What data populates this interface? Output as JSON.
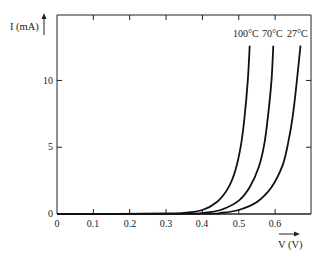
{
  "chart_data": {
    "type": "line",
    "title": "",
    "xlabel": "V (V)",
    "ylabel": "I (mA)",
    "xlim": [
      0,
      0.7
    ],
    "ylim": [
      0,
      14.9
    ],
    "grid": false,
    "legend_position": "inline-top-labels",
    "x_ticks": [
      0,
      0.1,
      0.2,
      0.3,
      0.4,
      0.5,
      0.6
    ],
    "x_tick_labels": [
      "0",
      "0.1",
      "0.2",
      "0.3",
      "0.4",
      "0.5",
      "0.6"
    ],
    "y_ticks": [
      0,
      5,
      10
    ],
    "y_tick_labels": [
      "0",
      "5",
      "10"
    ],
    "series": [
      {
        "name": "100°C",
        "x": [
          0.0,
          0.3,
          0.35,
          0.4,
          0.44,
          0.47,
          0.49,
          0.505,
          0.515,
          0.525,
          0.53
        ],
        "y": [
          0.0,
          0.02,
          0.08,
          0.3,
          0.9,
          1.9,
          3.2,
          5.0,
          7.0,
          10.0,
          12.6
        ]
      },
      {
        "name": "70°C",
        "x": [
          0.0,
          0.35,
          0.4,
          0.45,
          0.5,
          0.53,
          0.555,
          0.57,
          0.58,
          0.59,
          0.595
        ],
        "y": [
          0.0,
          0.02,
          0.08,
          0.3,
          1.0,
          2.0,
          3.5,
          5.2,
          7.2,
          10.0,
          12.6
        ]
      },
      {
        "name": "27°C",
        "x": [
          0.0,
          0.4,
          0.45,
          0.5,
          0.55,
          0.59,
          0.62,
          0.635,
          0.648,
          0.66,
          0.67
        ],
        "y": [
          0.0,
          0.02,
          0.08,
          0.3,
          0.9,
          2.0,
          3.6,
          5.2,
          7.2,
          10.0,
          12.6
        ]
      }
    ]
  },
  "labels": {
    "y_axis": "I (mA)",
    "x_axis": "V (V)",
    "series_100": "100°C",
    "series_70": "70°C",
    "series_27": "27°C",
    "y_tick_0": "0",
    "y_tick_5": "5",
    "y_tick_10": "10",
    "x_tick_0": "0",
    "x_tick_1": "0.1",
    "x_tick_2": "0.2",
    "x_tick_3": "0.3",
    "x_tick_4": "0.4",
    "x_tick_5": "0.5",
    "x_tick_6": "0.6"
  },
  "colors": {
    "curve": "#111111",
    "axis": "#222222",
    "text": "#1a1a1a"
  }
}
